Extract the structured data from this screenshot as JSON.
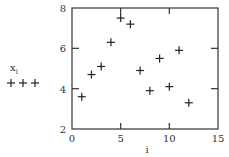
{
  "chart_data": {
    "type": "scatter",
    "title": "",
    "xlabel": "i",
    "ylabel": "x_i",
    "xlim": [
      0,
      15
    ],
    "ylim": [
      2,
      8
    ],
    "xticks": [
      0,
      5,
      10,
      15
    ],
    "yticks": [
      2,
      4,
      6,
      8
    ],
    "xtick_labels": [
      "0",
      "5",
      "10",
      "15"
    ],
    "ytick_labels": [
      "2",
      "4",
      "6",
      "8"
    ],
    "grid": false,
    "marker": "plus",
    "legend": {
      "position": "left",
      "entries": [
        {
          "label_main": "x",
          "label_sub": "i",
          "marker": "+ + +"
        }
      ]
    },
    "series": [
      {
        "name": "x_i",
        "x": [
          1,
          2,
          3,
          4,
          5,
          6,
          7,
          8,
          9,
          10,
          11,
          12
        ],
        "y": [
          3.6,
          4.7,
          5.1,
          6.3,
          7.5,
          7.2,
          4.9,
          3.9,
          5.5,
          4.1,
          5.9,
          3.3
        ]
      }
    ]
  },
  "colors": {
    "axis": "#333333",
    "marker": "#222222",
    "background": "#ffffff"
  }
}
